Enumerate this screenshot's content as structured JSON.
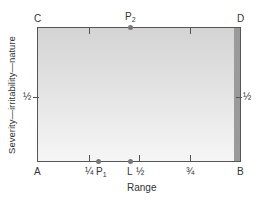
{
  "diagram": {
    "corners": {
      "top_left": "C",
      "top_right": "D",
      "bottom_left": "A",
      "bottom_right": "B"
    },
    "x_axis": {
      "label": "Range",
      "ticks": [
        {
          "label": "¼",
          "value": 0.25
        },
        {
          "label": "½",
          "value": 0.5
        },
        {
          "label": "¾",
          "value": 0.75
        }
      ]
    },
    "y_axis": {
      "label": "Severity—irritability—nature",
      "left_tick": "½",
      "right_tick": "½"
    },
    "points": [
      {
        "name": "P",
        "sub": "1",
        "position": "bottom",
        "value": 0.3
      },
      {
        "name": "L",
        "sub": "",
        "position": "bottom",
        "value": 0.46
      },
      {
        "name": "P",
        "sub": "2",
        "position": "top",
        "value": 0.46
      }
    ],
    "colors": {
      "fill_top": "#d4d4d4",
      "fill_bottom": "#f6f6f6",
      "edge_strip": "#9a9a9a",
      "lines": "#555555",
      "points": "#777777"
    }
  }
}
